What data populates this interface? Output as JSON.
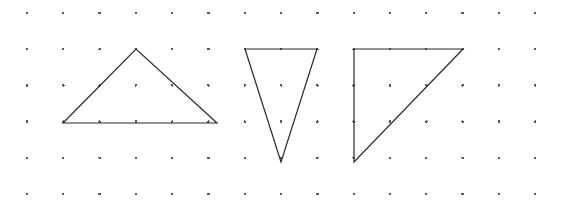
{
  "figure": {
    "width": 568,
    "height": 210,
    "background_color": "#ffffff"
  },
  "grid": {
    "name": "dot-lattice",
    "columns": 15,
    "rows": 6,
    "origin_x": 27,
    "origin_y": 13,
    "spacing_x": 36.3,
    "spacing_y": 36.2,
    "dot_radius": 1.3,
    "dot_color": "#5a5a5a"
  },
  "shapes": [
    {
      "name": "triangle-isosceles-upward",
      "label": "Triangle 1",
      "kind": "triangle",
      "orientation": "upward",
      "stroke_color": "#2b2b2b",
      "stroke_width": 1.2,
      "fill": "none",
      "vertices": [
        {
          "col": 1,
          "row": 3,
          "x": 63,
          "y": 123
        },
        {
          "col": 3,
          "row": 1,
          "x": 136,
          "y": 49
        },
        {
          "col": 5,
          "row": 3,
          "x": 217,
          "y": 123
        }
      ]
    },
    {
      "name": "triangle-downward-narrow",
      "label": "Triangle 2",
      "kind": "triangle",
      "orientation": "downward",
      "stroke_color": "#2b2b2b",
      "stroke_width": 1.2,
      "fill": "none",
      "vertices": [
        {
          "col": 6,
          "row": 1,
          "x": 245,
          "y": 49
        },
        {
          "col": 8,
          "row": 1,
          "x": 317,
          "y": 49
        },
        {
          "col": 7,
          "row": 4,
          "x": 281,
          "y": 162
        }
      ]
    },
    {
      "name": "triangle-right-angled",
      "label": "Triangle 3",
      "kind": "triangle",
      "orientation": "right-angle-top-left",
      "stroke_color": "#2b2b2b",
      "stroke_width": 1.2,
      "fill": "none",
      "vertices": [
        {
          "col": 9,
          "row": 1,
          "x": 354,
          "y": 49
        },
        {
          "col": 12,
          "row": 1,
          "x": 463,
          "y": 49
        },
        {
          "col": 9,
          "row": 4,
          "x": 354,
          "y": 162
        }
      ]
    }
  ]
}
